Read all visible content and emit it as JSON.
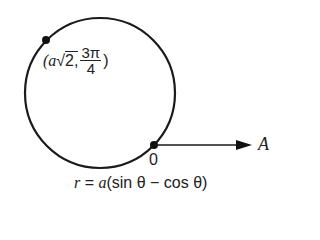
{
  "diagram": {
    "type": "polar-curve",
    "curve": {
      "shape": "circle",
      "center_px": [
        100,
        93
      ],
      "radius_px": 75,
      "stroke": "#1a1a1a"
    },
    "point": {
      "label_prefix": "(a",
      "sqrt_symbol": "√",
      "sqrt_arg": "2,",
      "frac_num": "3π",
      "frac_den": "4",
      "label_suffix": ")"
    },
    "pole": {
      "label": "0"
    },
    "polar_axis": {
      "label": "A"
    },
    "equation": {
      "lhs": "r",
      "eq": " = ",
      "a": "a",
      "rhs": "(sin θ − cos θ)"
    }
  }
}
